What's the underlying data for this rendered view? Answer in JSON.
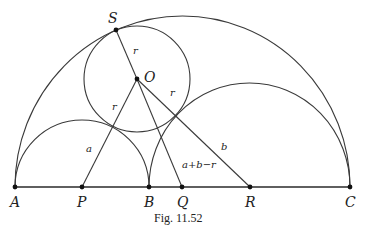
{
  "figure": {
    "caption": "Fig. 11.52",
    "points": {
      "A": {
        "label": "A",
        "x": 15,
        "y": 187
      },
      "P": {
        "label": "P",
        "x": 82,
        "y": 187
      },
      "B": {
        "label": "B",
        "x": 149,
        "y": 187
      },
      "Q": {
        "label": "Q",
        "x": 182,
        "y": 187
      },
      "R": {
        "label": "R",
        "x": 250,
        "y": 187
      },
      "C": {
        "label": "C",
        "x": 350,
        "y": 187
      },
      "S": {
        "label": "S",
        "x": 116,
        "y": 30
      },
      "O": {
        "label": "O",
        "x": 137,
        "y": 79
      }
    },
    "segment_labels": {
      "OS": "r",
      "OP": "r",
      "OR": "r",
      "PX": "a",
      "RX": "b",
      "OQ": "a+b−r"
    },
    "shapes": [
      "semicircle on AC centered at Q",
      "semicircle on AB centered at P",
      "semicircle on BC centered at R",
      "circle centered at O radius r tangent at S"
    ]
  }
}
